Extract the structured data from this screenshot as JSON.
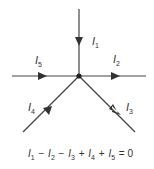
{
  "diagram": {
    "type": "kirchhoff-current-law-junction",
    "junction": {
      "x": 79,
      "y": 76
    },
    "colors": {
      "line": "#444444",
      "text": "#333333"
    },
    "branches": [
      {
        "id": "I1",
        "label": "I",
        "sub": "1",
        "direction": "in",
        "from": [
          79,
          9
        ],
        "to": [
          79,
          76
        ]
      },
      {
        "id": "I2",
        "label": "I",
        "sub": "2",
        "direction": "out",
        "from": [
          79,
          76
        ],
        "to": [
          146,
          76
        ]
      },
      {
        "id": "I3",
        "label": "I",
        "sub": "3",
        "direction": "out",
        "from": [
          79,
          76
        ],
        "to": [
          135,
          132
        ]
      },
      {
        "id": "I4",
        "label": "I",
        "sub": "4",
        "direction": "in",
        "from": [
          23,
          132
        ],
        "to": [
          79,
          76
        ]
      },
      {
        "id": "I5",
        "label": "I",
        "sub": "5",
        "direction": "in",
        "from": [
          12,
          76
        ],
        "to": [
          79,
          76
        ]
      }
    ],
    "equation": {
      "terms": [
        {
          "sign": "",
          "var": "I",
          "sub": "1"
        },
        {
          "sign": "−",
          "var": "I",
          "sub": "2"
        },
        {
          "sign": "−",
          "var": "I",
          "sub": "3"
        },
        {
          "sign": "+",
          "var": "I",
          "sub": "4"
        },
        {
          "sign": "+",
          "var": "I",
          "sub": "5"
        }
      ],
      "rhs": "= 0",
      "text": "I1 − I2 − I3 + I4 + I5 = 0"
    }
  }
}
